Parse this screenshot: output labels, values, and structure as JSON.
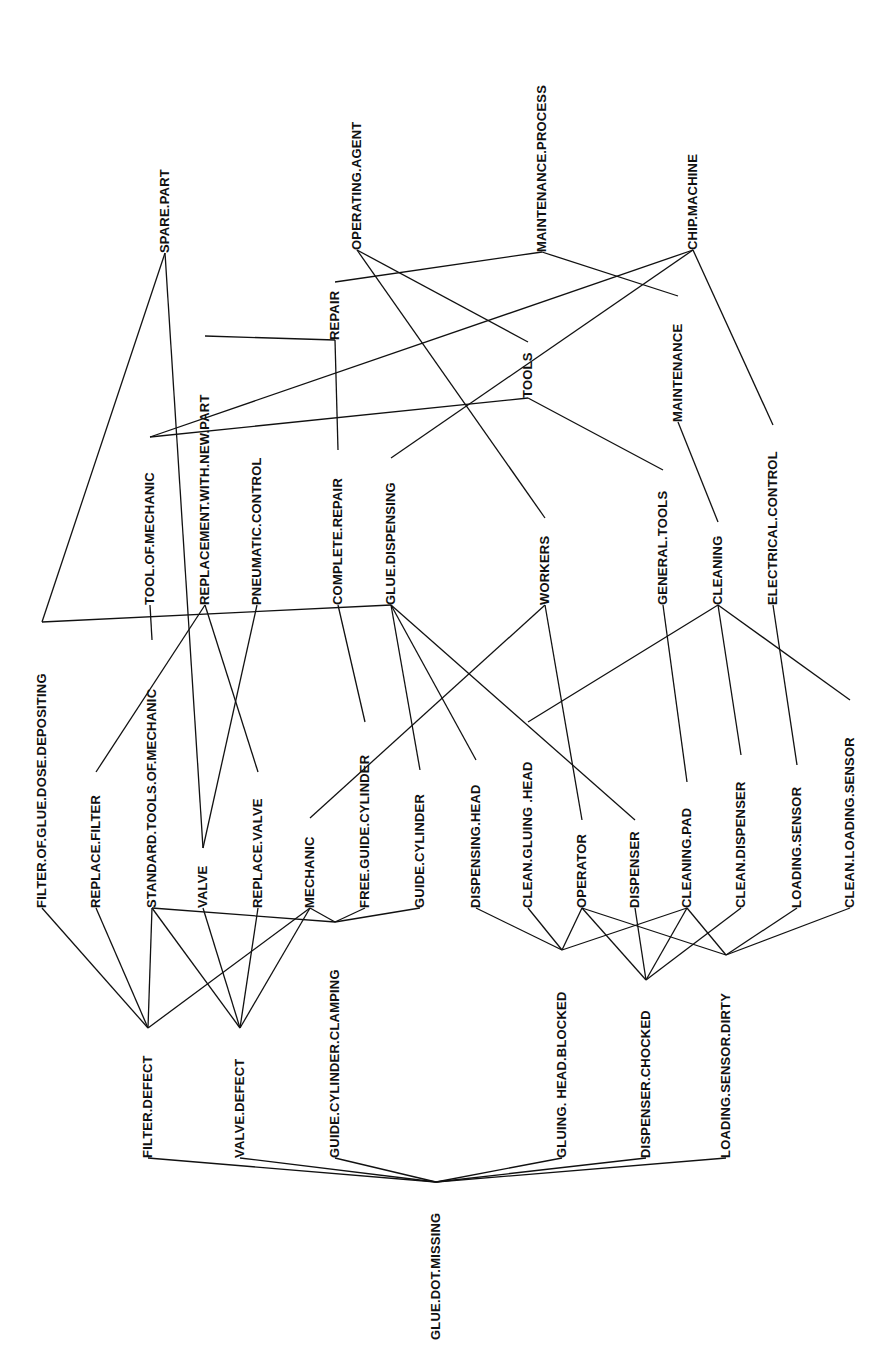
{
  "diagram": {
    "type": "concept-graph",
    "root": "GLUE.DOT.MISSING",
    "nodes": [
      {
        "id": "maintenance_process",
        "label": "MAINTENANCE.PROCESS",
        "x": 542,
        "yTop": 48,
        "yBot": 252
      },
      {
        "id": "operating_agent",
        "label": "OPERATING.AGENT",
        "x": 357,
        "yTop": 96,
        "yBot": 250
      },
      {
        "id": "chip_machine",
        "label": "CHIP.MACHINE",
        "x": 693,
        "yTop": 128,
        "yBot": 250
      },
      {
        "id": "spare_part",
        "label": "SPARE.PART",
        "x": 165,
        "yTop": 155,
        "yBot": 253
      },
      {
        "id": "repair",
        "label": "REPAIR",
        "x": 335,
        "yTop": 282,
        "yBot": 340
      },
      {
        "id": "replacement_with_new_part",
        "label": "REPLACEMENT.WITH.NEW.PART",
        "x": 205,
        "yTop": 336,
        "yBot": 605
      },
      {
        "id": "maintenance",
        "label": "MAINTENANCE",
        "x": 678,
        "yTop": 296,
        "yBot": 422
      },
      {
        "id": "tools",
        "label": "TOOLS",
        "x": 528,
        "yTop": 342,
        "yBot": 398
      },
      {
        "id": "tool_of_mechanic",
        "label": "TOOL.OF.MECHANIC",
        "x": 150,
        "yTop": 437,
        "yBot": 605
      },
      {
        "id": "pneumatic_control",
        "label": "PNEUMATIC.CONTROL",
        "x": 257,
        "yTop": 422,
        "yBot": 605
      },
      {
        "id": "complete_repair",
        "label": "COMPLETE.REPAIR",
        "x": 338,
        "yTop": 450,
        "yBot": 605
      },
      {
        "id": "glue_dispensing",
        "label": "GLUE.DISPENSING",
        "x": 391,
        "yTop": 458,
        "yBot": 605
      },
      {
        "id": "workers",
        "label": "WORKERS",
        "x": 545,
        "yTop": 518,
        "yBot": 605
      },
      {
        "id": "general_tools",
        "label": "GENERAL.TOOLS",
        "x": 663,
        "yTop": 470,
        "yBot": 605
      },
      {
        "id": "cleaning",
        "label": "CLEANING",
        "x": 718,
        "yTop": 522,
        "yBot": 605
      },
      {
        "id": "electrical_control",
        "label": "ELECTRICAL.CONTROL",
        "x": 773,
        "yTop": 425,
        "yBot": 605
      },
      {
        "id": "filter_of_glue_dose_depositing",
        "label": "FILTER.OF.GLUE.DOSE.DEPOSITING",
        "x": 42,
        "yTop": 622,
        "yBot": 908
      },
      {
        "id": "replace_filter",
        "label": "REPLACE.FILTER",
        "x": 96,
        "yTop": 772,
        "yBot": 908
      },
      {
        "id": "standard_tools_of_mechanic",
        "label": "STANDARD.TOOLS.OF.MECHANIC",
        "x": 152,
        "yTop": 640,
        "yBot": 908
      },
      {
        "id": "valve",
        "label": "VALVE",
        "x": 203,
        "yTop": 848,
        "yBot": 908
      },
      {
        "id": "replace_valve",
        "label": "REPLACE.VALVE",
        "x": 258,
        "yTop": 772,
        "yBot": 908
      },
      {
        "id": "mechanic",
        "label": "MECHANIC",
        "x": 310,
        "yTop": 818,
        "yBot": 908
      },
      {
        "id": "free_guide_cylinder",
        "label": "FREE.GUIDE.CYLINDER",
        "x": 365,
        "yTop": 722,
        "yBot": 908
      },
      {
        "id": "guide_cylinder",
        "label": "GUIDE.CYLINDER",
        "x": 420,
        "yTop": 770,
        "yBot": 908
      },
      {
        "id": "dispensing_head",
        "label": "DISPENSING.HEAD",
        "x": 476,
        "yTop": 760,
        "yBot": 908
      },
      {
        "id": "clean_gluing_head",
        "label": "CLEAN.GLUING  .HEAD",
        "x": 528,
        "yTop": 722,
        "yBot": 908
      },
      {
        "id": "operator",
        "label": "OPERATOR",
        "x": 582,
        "yTop": 820,
        "yBot": 908
      },
      {
        "id": "dispenser",
        "label": "DISPENSER",
        "x": 635,
        "yTop": 820,
        "yBot": 908
      },
      {
        "id": "cleaning_pad",
        "label": "CLEANING.PAD",
        "x": 687,
        "yTop": 782,
        "yBot": 908
      },
      {
        "id": "clean_dispenser",
        "label": "CLEAN.DISPENSER",
        "x": 741,
        "yTop": 755,
        "yBot": 908
      },
      {
        "id": "loading_sensor",
        "label": "LOADING.SENSOR",
        "x": 797,
        "yTop": 765,
        "yBot": 908
      },
      {
        "id": "clean_loading_sensor",
        "label": "CLEAN.LOADING.SENSOR",
        "x": 850,
        "yTop": 700,
        "yBot": 908
      },
      {
        "id": "filter_defect",
        "label": "FILTER.DEFECT",
        "x": 148,
        "yTop": 1028,
        "yBot": 1158
      },
      {
        "id": "valve_defect",
        "label": "VALVE.DEFECT",
        "x": 240,
        "yTop": 1028,
        "yBot": 1158
      },
      {
        "id": "guide_cylinder_clamping",
        "label": "GUIDE.CYLINDER.CLAMPING",
        "x": 335,
        "yTop": 922,
        "yBot": 1158
      },
      {
        "id": "gluing_head_blocked",
        "label": "GLUING.  HEAD.BLOCKED",
        "x": 562,
        "yTop": 950,
        "yBot": 1158
      },
      {
        "id": "dispenser_chocked",
        "label": "DISPENSER.CHOCKED",
        "x": 646,
        "yTop": 980,
        "yBot": 1158
      },
      {
        "id": "loading_sensor_dirty",
        "label": "LOADING.SENSOR.DIRTY",
        "x": 726,
        "yTop": 955,
        "yBot": 1158
      },
      {
        "id": "glue_dot_missing",
        "label": "GLUE.DOT.MISSING",
        "x": 436,
        "yTop": 1182,
        "yBot": 1340
      }
    ],
    "edges": [
      [
        "maintenance_process",
        "repair"
      ],
      [
        "maintenance_process",
        "maintenance"
      ],
      [
        "operating_agent",
        "tools"
      ],
      [
        "operating_agent",
        "workers"
      ],
      [
        "chip_machine",
        "tool_of_mechanic"
      ],
      [
        "chip_machine",
        "glue_dispensing"
      ],
      [
        "chip_machine",
        "electrical_control"
      ],
      [
        "spare_part",
        "filter_of_glue_dose_depositing"
      ],
      [
        "spare_part",
        "valve"
      ],
      [
        "repair",
        "replacement_with_new_part"
      ],
      [
        "repair",
        "complete_repair"
      ],
      [
        "maintenance",
        "cleaning"
      ],
      [
        "tools",
        "tool_of_mechanic"
      ],
      [
        "tools",
        "general_tools"
      ],
      [
        "tool_of_mechanic",
        "standard_tools_of_mechanic"
      ],
      [
        "replacement_with_new_part",
        "replace_filter"
      ],
      [
        "replacement_with_new_part",
        "replace_valve"
      ],
      [
        "pneumatic_control",
        "valve"
      ],
      [
        "complete_repair",
        "free_guide_cylinder"
      ],
      [
        "glue_dispensing",
        "filter_of_glue_dose_depositing"
      ],
      [
        "glue_dispensing",
        "guide_cylinder"
      ],
      [
        "glue_dispensing",
        "dispensing_head"
      ],
      [
        "glue_dispensing",
        "dispenser"
      ],
      [
        "workers",
        "mechanic"
      ],
      [
        "workers",
        "operator"
      ],
      [
        "general_tools",
        "cleaning_pad"
      ],
      [
        "cleaning",
        "clean_gluing_head"
      ],
      [
        "cleaning",
        "clean_dispenser"
      ],
      [
        "cleaning",
        "clean_loading_sensor"
      ],
      [
        "electrical_control",
        "loading_sensor"
      ],
      [
        "filter_of_glue_dose_depositing",
        "filter_defect"
      ],
      [
        "replace_filter",
        "filter_defect"
      ],
      [
        "standard_tools_of_mechanic",
        "filter_defect"
      ],
      [
        "mechanic",
        "filter_defect"
      ],
      [
        "standard_tools_of_mechanic",
        "valve_defect"
      ],
      [
        "valve",
        "valve_defect"
      ],
      [
        "replace_valve",
        "valve_defect"
      ],
      [
        "mechanic",
        "valve_defect"
      ],
      [
        "standard_tools_of_mechanic",
        "guide_cylinder_clamping"
      ],
      [
        "mechanic",
        "guide_cylinder_clamping"
      ],
      [
        "free_guide_cylinder",
        "guide_cylinder_clamping"
      ],
      [
        "guide_cylinder",
        "guide_cylinder_clamping"
      ],
      [
        "dispensing_head",
        "gluing_head_blocked"
      ],
      [
        "clean_gluing_head",
        "gluing_head_blocked"
      ],
      [
        "operator",
        "gluing_head_blocked"
      ],
      [
        "cleaning_pad",
        "gluing_head_blocked"
      ],
      [
        "operator",
        "dispenser_chocked"
      ],
      [
        "dispenser",
        "dispenser_chocked"
      ],
      [
        "cleaning_pad",
        "dispenser_chocked"
      ],
      [
        "clean_dispenser",
        "dispenser_chocked"
      ],
      [
        "operator",
        "loading_sensor_dirty"
      ],
      [
        "cleaning_pad",
        "loading_sensor_dirty"
      ],
      [
        "loading_sensor",
        "loading_sensor_dirty"
      ],
      [
        "clean_loading_sensor",
        "loading_sensor_dirty"
      ],
      [
        "filter_defect",
        "glue_dot_missing"
      ],
      [
        "valve_defect",
        "glue_dot_missing"
      ],
      [
        "guide_cylinder_clamping",
        "glue_dot_missing"
      ],
      [
        "gluing_head_blocked",
        "glue_dot_missing"
      ],
      [
        "dispenser_chocked",
        "glue_dot_missing"
      ],
      [
        "loading_sensor_dirty",
        "glue_dot_missing"
      ]
    ]
  }
}
